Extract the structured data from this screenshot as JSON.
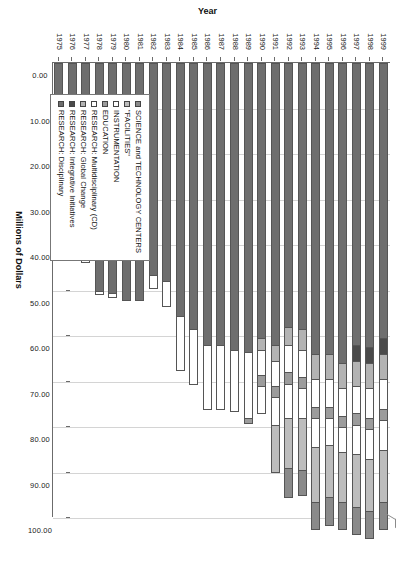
{
  "chart_data": {
    "type": "bar",
    "orientation": "horizontal-stacked",
    "title": "",
    "xlabel": "Millions of Dollars",
    "ylabel": "Year",
    "xlim": [
      0,
      100
    ],
    "xticks": [
      "0.00",
      "10.00",
      "20.00",
      "30.00",
      "40.00",
      "50.00",
      "60.00",
      "70.00",
      "80.00",
      "90.00",
      "100.00"
    ],
    "grid": true,
    "legend_position": "lower-left-inside",
    "categories": [
      "1975",
      "1976",
      "1977",
      "1978",
      "1979",
      "1980",
      "1981",
      "1982",
      "1983",
      "1984",
      "1985",
      "1986",
      "1987",
      "1988",
      "1989",
      "1990",
      "1991",
      "1992",
      "1993",
      "1994",
      "1995",
      "1996",
      "1997",
      "1998",
      "1999"
    ],
    "series": [
      {
        "name": "RESEARCH: Disciplinary",
        "color": "#6e6e6e",
        "values": [
          38.0,
          41.0,
          43.0,
          50.0,
          50.5,
          52.0,
          52.0,
          46.5,
          48.0,
          55.5,
          58.5,
          62.0,
          62.0,
          63.0,
          63.5,
          60.5,
          62.0,
          58.0,
          58.5,
          64.0,
          64.0,
          66.0,
          62.0,
          62.5,
          60.5
        ]
      },
      {
        "name": "RESEARCH: Integrative Initiatives",
        "color": "#4a4a4a",
        "values": [
          0,
          0,
          0,
          0,
          0,
          0,
          0,
          0,
          0,
          0,
          0,
          0,
          0,
          0,
          0,
          0,
          0,
          0,
          0,
          0,
          0,
          0,
          3.5,
          3.5,
          3.5
        ]
      },
      {
        "name": "RESEARCH: Global Change",
        "color": "#b3b3b3",
        "values": [
          0,
          0,
          0,
          0,
          0,
          0,
          0,
          0,
          0,
          0,
          0,
          0,
          0,
          0,
          0,
          2.5,
          3.5,
          4.0,
          4.5,
          5.5,
          5.5,
          5.5,
          5.5,
          5.5,
          5.5
        ]
      },
      {
        "name": "RESEARCH: Multidisciplinary (CD)",
        "color": "#ffffff",
        "values": [
          0.8,
          0.8,
          0.8,
          0.8,
          1.0,
          0,
          0,
          3.0,
          5.5,
          12.0,
          12.0,
          14.0,
          14.0,
          13.5,
          14.5,
          5.5,
          5.5,
          6.0,
          6.0,
          6.0,
          6.0,
          6.0,
          6.0,
          6.5,
          6.5
        ]
      },
      {
        "name": "EDUCATION",
        "color": "#9c9c9c",
        "values": [
          0,
          0,
          0,
          0,
          0,
          0,
          0,
          0,
          0,
          0,
          0,
          0,
          0,
          0,
          1.2,
          2.5,
          2.5,
          2.5,
          2.5,
          2.5,
          2.5,
          2.5,
          2.5,
          2.5,
          2.5
        ]
      },
      {
        "name": "INSTRUMENTATION",
        "color": "#ffffff",
        "values": [
          0,
          0,
          0,
          0,
          0,
          0,
          0,
          0,
          0,
          0,
          0,
          0,
          0,
          0,
          0,
          6.0,
          6.0,
          7.5,
          6.5,
          6.5,
          6.0,
          5.5,
          6.5,
          6.5,
          6.5
        ]
      },
      {
        "name": "\"FACILITIES\"",
        "color": "#bdbdbd",
        "values": [
          0,
          0,
          0,
          0,
          0,
          0,
          0,
          0,
          0,
          0,
          0,
          0,
          0,
          0,
          0,
          0,
          10.5,
          11.0,
          11.5,
          12.0,
          11.5,
          11.0,
          11.5,
          11.5,
          11.5
        ]
      },
      {
        "name": "SCIENCE and TECHNOLOGY CENTERS",
        "color": "#8a8a8a",
        "values": [
          0,
          0,
          0,
          0,
          0,
          0,
          0,
          0,
          0,
          0,
          0,
          0,
          0,
          0,
          0,
          0,
          0,
          6.5,
          5.5,
          6.0,
          6.0,
          6.0,
          6.0,
          6.0,
          6.0
        ]
      }
    ]
  },
  "legend": {
    "items": [
      {
        "label": "SCIENCE and TECHNOLOGY CENTERS",
        "color": "#8a8a8a"
      },
      {
        "label": "\"FACILITIES\"",
        "color": "#bdbdbd"
      },
      {
        "label": "INSTRUMENTATION",
        "color": "#ffffff"
      },
      {
        "label": "EDUCATION",
        "color": "#9c9c9c"
      },
      {
        "label": "RESEARCH: Multidisciplinary (CD)",
        "color": "#ffffff"
      },
      {
        "label": "RESEARCH: Global Change",
        "color": "#b3b3b3"
      },
      {
        "label": "RESEARCH: Integrative Initiatives",
        "color": "#4a4a4a"
      },
      {
        "label": "RESEARCH: Disciplinary",
        "color": "#6e6e6e"
      }
    ]
  },
  "axes": {
    "x_title": "Millions of Dollars",
    "y_title": "Year"
  }
}
